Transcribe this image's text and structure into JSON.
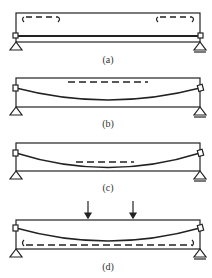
{
  "diagram": {
    "colors": {
      "stroke": "#222222",
      "background": "#ffffff"
    },
    "panels": [
      {
        "id": "a",
        "label": "(a)",
        "features": [
          "dashed-brackets-top-left",
          "dashed-brackets-top-right",
          "straight-inner-line"
        ]
      },
      {
        "id": "b",
        "label": "(b)",
        "features": [
          "dashed-line-top-center",
          "sagging-curve"
        ]
      },
      {
        "id": "c",
        "label": "(c)",
        "features": [
          "dashed-line-center",
          "sagging-curve"
        ]
      },
      {
        "id": "d",
        "label": "(d)",
        "features": [
          "two-load-arrows",
          "sagging-curve",
          "dashed-bracket-bottom"
        ]
      }
    ],
    "supports": {
      "left": "pin-triangle",
      "right": "roller-triangle"
    }
  }
}
